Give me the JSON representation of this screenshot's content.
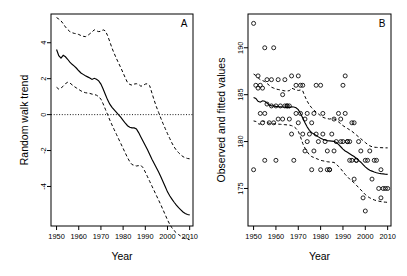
{
  "figure": {
    "title": "",
    "panels": [
      "A",
      "B"
    ]
  },
  "panel_a": {
    "id": "A",
    "ylabel": "Random walk trend",
    "xlabel": "Year",
    "xticks": [
      1950,
      1960,
      1970,
      1980,
      1990,
      2000,
      2010
    ],
    "yticks": [
      4,
      2,
      0,
      -2,
      -4
    ]
  },
  "panel_b": {
    "id": "B",
    "ylabel": "Observed and fitted values",
    "xlabel": "Year",
    "xticks": [
      1950,
      1960,
      1970,
      1980,
      1990,
      2000,
      2010
    ],
    "yticks": [
      190,
      185,
      180,
      175
    ]
  },
  "chart_data": [
    {
      "type": "line",
      "panel": "A",
      "title": "",
      "xlabel": "Year",
      "ylabel": "Random walk trend",
      "xlim": [
        1947.5,
        2011.5
      ],
      "ylim": [
        -6.2,
        5.6
      ],
      "grid": false,
      "legend": null,
      "xticks": [
        1950,
        1960,
        1970,
        1980,
        1990,
        2000,
        2010
      ],
      "yticks": [
        4,
        2,
        0,
        -2,
        -4
      ],
      "reference_line": {
        "y": 0,
        "style": "dotted"
      },
      "x": [
        1950,
        1951,
        1952,
        1953,
        1954,
        1955,
        1956,
        1957,
        1958,
        1959,
        1960,
        1961,
        1962,
        1963,
        1964,
        1965,
        1966,
        1967,
        1968,
        1969,
        1970,
        1971,
        1972,
        1973,
        1974,
        1975,
        1976,
        1977,
        1978,
        1979,
        1980,
        1981,
        1982,
        1983,
        1984,
        1985,
        1986,
        1987,
        1988,
        1989,
        1990,
        1991,
        1992,
        1993,
        1994,
        1995,
        1996,
        1997,
        1998,
        1999,
        2000,
        2001,
        2002,
        2003,
        2004,
        2005,
        2006,
        2007,
        2008,
        2009,
        2010
      ],
      "series": [
        {
          "name": "Random walk trend (fit)",
          "style": "solid",
          "values": [
            3.62,
            3.28,
            3.15,
            3.3,
            3.22,
            3.08,
            2.92,
            2.8,
            2.7,
            2.58,
            2.44,
            2.32,
            2.24,
            2.16,
            2.1,
            2.04,
            1.96,
            2.02,
            1.97,
            1.88,
            1.7,
            1.42,
            1.12,
            0.82,
            0.58,
            0.4,
            0.26,
            0.12,
            -0.02,
            -0.16,
            -0.32,
            -0.48,
            -0.62,
            -0.7,
            -0.74,
            -0.74,
            -0.8,
            -1.0,
            -1.24,
            -1.48,
            -1.72,
            -1.96,
            -2.22,
            -2.48,
            -2.72,
            -2.96,
            -3.2,
            -3.46,
            -3.74,
            -4.02,
            -4.3,
            -4.52,
            -4.7,
            -4.88,
            -5.04,
            -5.18,
            -5.3,
            -5.42,
            -5.5,
            -5.56,
            -5.58
          ]
        },
        {
          "name": "Upper 95% confidence band",
          "style": "dashed",
          "values": [
            5.4,
            5.32,
            5.22,
            5.06,
            4.88,
            4.74,
            4.62,
            4.56,
            4.52,
            4.5,
            4.46,
            4.4,
            4.36,
            4.34,
            4.4,
            4.5,
            4.6,
            4.72,
            4.66,
            4.62,
            4.64,
            4.72,
            4.66,
            4.4,
            4.06,
            3.7,
            3.4,
            3.12,
            2.86,
            2.6,
            2.32,
            2.04,
            1.78,
            1.68,
            1.64,
            1.7,
            1.72,
            1.68,
            1.58,
            1.62,
            1.7,
            1.72,
            1.6,
            1.2,
            0.8,
            0.44,
            0.12,
            -0.2,
            -0.5,
            -0.78,
            -1.06,
            -1.32,
            -1.58,
            -1.8,
            -1.98,
            -2.12,
            -2.24,
            -2.34,
            -2.4,
            -2.44,
            -2.46
          ]
        },
        {
          "name": "Lower 95% confidence band",
          "style": "dashed",
          "values": [
            1.52,
            1.42,
            1.48,
            1.58,
            1.72,
            1.8,
            1.76,
            1.66,
            1.56,
            1.48,
            1.4,
            1.32,
            1.26,
            1.22,
            1.2,
            1.18,
            1.14,
            1.12,
            1.08,
            1.0,
            0.86,
            0.6,
            0.3,
            0.0,
            -0.3,
            -0.58,
            -0.84,
            -1.1,
            -1.36,
            -1.62,
            -1.88,
            -2.14,
            -2.4,
            -2.62,
            -2.78,
            -2.82,
            -2.86,
            -2.84,
            -2.82,
            -2.96,
            -3.2,
            -3.46,
            -3.72,
            -3.98,
            -4.24,
            -4.5,
            -4.76,
            -5.02,
            -5.3,
            -5.58,
            -5.86,
            -6.1,
            -6.3,
            -6.46,
            -6.58,
            -6.68,
            -6.76,
            -6.84,
            -6.9,
            -6.94,
            -6.96
          ]
        }
      ]
    },
    {
      "type": "scatter",
      "panel": "B",
      "title": "",
      "xlabel": "Year",
      "ylabel": "Observed and fitted values",
      "xlim": [
        1947.5,
        2011.5
      ],
      "ylim": [
        171.0,
        193.6
      ],
      "grid": false,
      "legend": null,
      "xticks": [
        1950,
        1960,
        1970,
        1980,
        1990,
        2000,
        2010
      ],
      "yticks": [
        190,
        185,
        180,
        175
      ],
      "points": [
        [
          1950,
          192.6
        ],
        [
          1950,
          177.0
        ],
        [
          1951,
          186.0
        ],
        [
          1952,
          187.0
        ],
        [
          1952,
          185.7
        ],
        [
          1953,
          186.0
        ],
        [
          1953,
          183.0
        ],
        [
          1954,
          182.0
        ],
        [
          1954,
          185.7
        ],
        [
          1955,
          190.0
        ],
        [
          1955,
          183.0
        ],
        [
          1955,
          178.0
        ],
        [
          1956,
          186.6
        ],
        [
          1956,
          184.0
        ],
        [
          1957,
          182.0
        ],
        [
          1958,
          183.8
        ],
        [
          1958,
          186.6
        ],
        [
          1959,
          190.0
        ],
        [
          1959,
          182.0
        ],
        [
          1960,
          183.8
        ],
        [
          1960,
          178.0
        ],
        [
          1961,
          186.6
        ],
        [
          1961,
          182.4
        ],
        [
          1962,
          183.8
        ],
        [
          1963,
          185.0
        ],
        [
          1963,
          182.4
        ],
        [
          1964,
          183.8
        ],
        [
          1964,
          186.6
        ],
        [
          1965,
          183.8
        ],
        [
          1965,
          183.8
        ],
        [
          1966,
          183.8
        ],
        [
          1966,
          182.4
        ],
        [
          1967,
          187.0
        ],
        [
          1967,
          180.8
        ],
        [
          1968,
          178.0
        ],
        [
          1969,
          183.0
        ],
        [
          1969,
          186.0
        ],
        [
          1970,
          187.0
        ],
        [
          1970,
          182.0
        ],
        [
          1971,
          186.0
        ],
        [
          1971,
          183.0
        ],
        [
          1972,
          186.0
        ],
        [
          1972,
          180.8
        ],
        [
          1973,
          182.4
        ],
        [
          1973,
          179.0
        ],
        [
          1974,
          183.0
        ],
        [
          1974,
          180.0
        ],
        [
          1975,
          180.8
        ],
        [
          1976,
          182.0
        ],
        [
          1976,
          177.0
        ],
        [
          1977,
          183.0
        ],
        [
          1977,
          179.0
        ],
        [
          1978,
          180.8
        ],
        [
          1978,
          186.0
        ],
        [
          1979,
          180.0
        ],
        [
          1980,
          186.0
        ],
        [
          1980,
          177.0
        ],
        [
          1981,
          180.8
        ],
        [
          1981,
          183.0
        ],
        [
          1982,
          180.0
        ],
        [
          1983,
          179.0
        ],
        [
          1983,
          177.0
        ],
        [
          1984,
          177.0
        ],
        [
          1984,
          177.0
        ],
        [
          1985,
          180.8
        ],
        [
          1986,
          182.4
        ],
        [
          1986,
          179.0
        ],
        [
          1987,
          180.0
        ],
        [
          1988,
          183.0
        ],
        [
          1989,
          182.4
        ],
        [
          1989,
          180.0
        ],
        [
          1990,
          186.0
        ],
        [
          1990,
          180.0
        ],
        [
          1991,
          187.0
        ],
        [
          1991,
          183.0
        ],
        [
          1992,
          180.0
        ],
        [
          1992,
          180.0
        ],
        [
          1993,
          180.0
        ],
        [
          1993,
          178.0
        ],
        [
          1994,
          182.0
        ],
        [
          1994,
          178.0
        ],
        [
          1995,
          182.0
        ],
        [
          1995,
          176.0
        ],
        [
          1996,
          178.0
        ],
        [
          1996,
          178.0
        ],
        [
          1997,
          180.0
        ],
        [
          1998,
          179.0
        ],
        [
          1999,
          174.0
        ],
        [
          2000,
          172.6
        ],
        [
          2000,
          178.0
        ],
        [
          2001,
          178.0
        ],
        [
          2002,
          179.0
        ],
        [
          2003,
          176.0
        ],
        [
          2004,
          178.0
        ],
        [
          2005,
          178.0
        ],
        [
          2006,
          175.0
        ],
        [
          2007,
          174.0
        ],
        [
          2007,
          177.0
        ],
        [
          2008,
          175.0
        ],
        [
          2009,
          175.0
        ],
        [
          2010,
          175.0
        ]
      ],
      "x": [
        1950,
        1951,
        1952,
        1953,
        1954,
        1955,
        1956,
        1957,
        1958,
        1959,
        1960,
        1961,
        1962,
        1963,
        1964,
        1965,
        1966,
        1967,
        1968,
        1969,
        1970,
        1971,
        1972,
        1973,
        1974,
        1975,
        1976,
        1977,
        1978,
        1979,
        1980,
        1981,
        1982,
        1983,
        1984,
        1985,
        1986,
        1987,
        1988,
        1989,
        1990,
        1991,
        1992,
        1993,
        1994,
        1995,
        1996,
        1997,
        1998,
        1999,
        2000,
        2001,
        2002,
        2003,
        2004,
        2005,
        2006,
        2007,
        2008,
        2009,
        2010
      ],
      "series": [
        {
          "name": "Fitted values",
          "style": "solid",
          "values": [
            184.7,
            184.6,
            184.3,
            184.2,
            184.35,
            184.3,
            184.1,
            183.9,
            183.8,
            183.8,
            183.75,
            183.72,
            183.7,
            183.68,
            183.66,
            183.64,
            183.62,
            183.7,
            183.68,
            183.6,
            183.4,
            183.0,
            182.5,
            182.0,
            181.55,
            181.2,
            180.95,
            180.8,
            180.65,
            180.5,
            180.35,
            180.25,
            180.18,
            180.1,
            180.08,
            180.05,
            180.02,
            179.9,
            179.7,
            179.45,
            179.2,
            179.0,
            178.85,
            178.7,
            178.55,
            178.4,
            178.2,
            178.0,
            177.8,
            177.55,
            177.3,
            177.1,
            176.95,
            176.85,
            176.75,
            176.68,
            176.62,
            176.58,
            176.55,
            176.52,
            176.5
          ]
        },
        {
          "name": "Upper 95% confidence band",
          "style": "dashed",
          "values": [
            187.2,
            187.05,
            186.8,
            186.6,
            186.5,
            186.4,
            186.2,
            186.0,
            185.8,
            185.7,
            185.6,
            185.55,
            185.5,
            185.45,
            185.4,
            185.4,
            185.42,
            185.7,
            185.6,
            185.5,
            185.45,
            185.5,
            185.4,
            184.8,
            184.3,
            183.9,
            183.6,
            183.35,
            183.15,
            182.95,
            182.75,
            182.6,
            182.5,
            182.45,
            182.4,
            182.45,
            182.42,
            182.3,
            182.1,
            181.9,
            181.7,
            181.55,
            181.4,
            181.25,
            181.1,
            180.9,
            180.7,
            180.5,
            180.3,
            180.1,
            179.9,
            179.7,
            179.55,
            179.45,
            179.4,
            179.38,
            179.36,
            179.35,
            179.34,
            179.33,
            179.33
          ]
        },
        {
          "name": "Lower 95% confidence band",
          "style": "dashed",
          "values": [
            182.2,
            182.15,
            181.9,
            181.85,
            182.2,
            182.15,
            182.05,
            181.95,
            181.9,
            181.9,
            181.88,
            181.86,
            181.84,
            181.82,
            181.8,
            181.78,
            181.76,
            181.7,
            181.6,
            181.4,
            181.1,
            180.5,
            179.8,
            179.3,
            178.9,
            178.6,
            178.4,
            178.3,
            178.2,
            178.1,
            178.0,
            177.95,
            177.9,
            177.85,
            177.82,
            177.8,
            177.78,
            177.6,
            177.35,
            177.1,
            176.8,
            176.5,
            176.25,
            176.0,
            175.8,
            175.6,
            175.35,
            175.1,
            174.85,
            174.6,
            174.35,
            174.15,
            174.0,
            173.88,
            173.78,
            173.7,
            173.65,
            173.6,
            173.56,
            173.54,
            173.52
          ]
        }
      ]
    }
  ]
}
